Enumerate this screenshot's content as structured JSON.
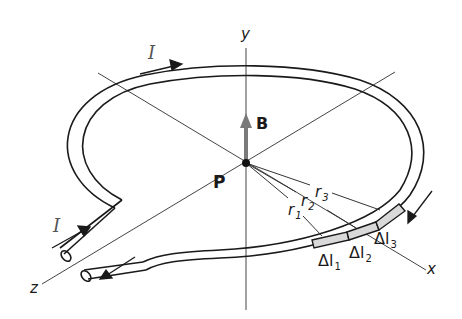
{
  "figure": {
    "labels": {
      "current_top": "I",
      "current_lead": "I",
      "field": "B",
      "point": "P",
      "axis_x": "x",
      "axis_y": "y",
      "axis_z": "z",
      "r1": "r",
      "r1_sub": "1",
      "r2": "r",
      "r2_sub": "2",
      "r3": "r",
      "r3_sub": "3",
      "dl1": "Δl",
      "dl1_sub": "1",
      "dl2": "Δl",
      "dl2_sub": "2",
      "dl3": "Δl",
      "dl3_sub": "3"
    },
    "colors": {
      "wire": "#1a1a1a",
      "axis": "#444444",
      "field_arrow": "#7a7a7a",
      "segment_fill": "#d9d9d9"
    }
  }
}
